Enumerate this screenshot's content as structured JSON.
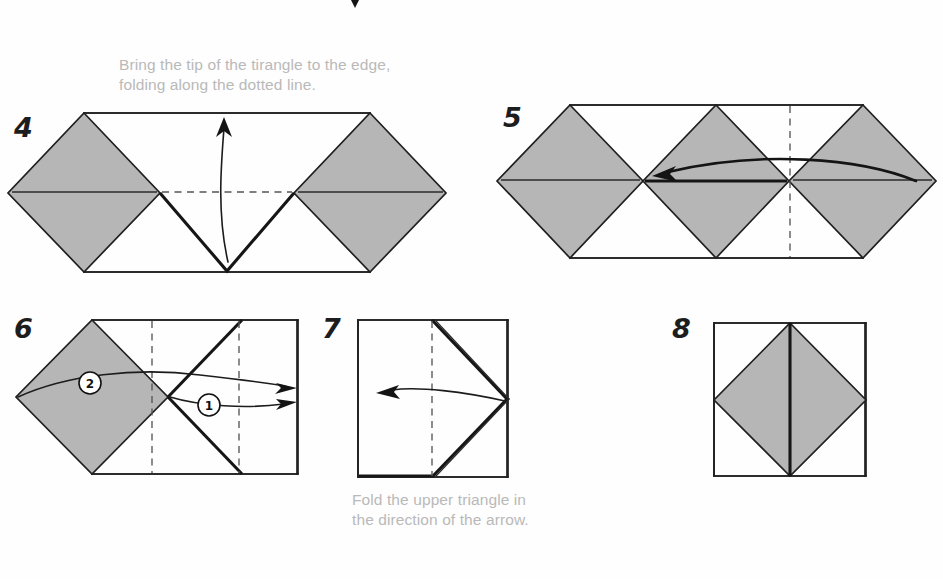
{
  "page": {
    "width": 943,
    "height": 579,
    "background": "#fefefe",
    "gray_fill": "#b6b6b6",
    "line_color": "#1f1f1f",
    "caption_color": "#b9b9b9"
  },
  "captions": {
    "step4_line1": "Bring the tip of the tirangle to the edge,",
    "step4_line2": "folding along the dotted line.",
    "step7_line1": "Fold the upper triangle in",
    "step7_line2": "the direction of the arrow."
  },
  "steps": [
    {
      "id": "step-4",
      "number": "4",
      "number_pos": {
        "x": 14,
        "y": 137
      },
      "caption_lines": [
        "Bring the tip of the tirangle to the edge,",
        "folding along the dotted line."
      ],
      "caption_pos": {
        "x": 119,
        "y": 70
      },
      "description": "Wide band with two gray diamonds at left and right and a white V notch in the middle; straight arrow curving upward from the bottom notch."
    },
    {
      "id": "step-5",
      "number": "5",
      "number_pos": {
        "x": 503,
        "y": 127
      },
      "caption_lines": [],
      "description": "Three gray diamonds in a row with a vertical dashed fold line right of center; bold curved arrow sweeping from right to left."
    },
    {
      "id": "step-6",
      "number": "6",
      "number_pos": {
        "x": 14,
        "y": 338
      },
      "caption_lines": [],
      "markers": [
        {
          "label": "2",
          "cx": 90,
          "cy": 383,
          "r": 11
        },
        {
          "label": "1",
          "cx": 209,
          "cy": 405,
          "r": 11
        }
      ],
      "description": "Rectangle with a gray diamond at the left, two vertical dashed fold lines and a bold X crease; two curved arrows numbered 2 and 1 point to the right."
    },
    {
      "id": "step-7",
      "number": "7",
      "number_pos": {
        "x": 322,
        "y": 338
      },
      "caption_lines": [
        "Fold the upper triangle in",
        "the direction of the arrow."
      ],
      "caption_pos": {
        "x": 352,
        "y": 505
      },
      "description": "Square with a vertical dashed centre line and a bold chevron opening to the left; curved arrow points left."
    },
    {
      "id": "step-8",
      "number": "8",
      "number_pos": {
        "x": 672,
        "y": 338
      },
      "caption_lines": [],
      "description": "Finished square with an inscribed gray diamond divided by a bold vertical centre line."
    }
  ],
  "stray_mark": {
    "name": "cropped-arrowhead",
    "x": 355,
    "y": 2
  }
}
